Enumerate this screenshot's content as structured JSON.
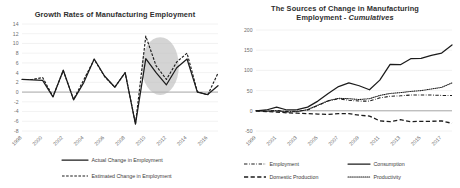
{
  "left_panel": {
    "title": "Growth Rates of Manufacturing Employment",
    "legend": [
      {
        "label": "Actual Change in Employment",
        "style": "solid"
      },
      {
        "label": "Estimated Change in Employment",
        "style": "dashed"
      }
    ],
    "highlight_note": "gray-ellipse-highlight"
  },
  "right_panel": {
    "title_line1": "The Sources of Change in Manufacturing",
    "title_line2_plain": "Employment - ",
    "title_line2_italic": "Cumulatives",
    "legend": [
      {
        "label": "Employment",
        "style": "dash-dot"
      },
      {
        "label": "Consumption",
        "style": "solid"
      },
      {
        "label": "Domestic Production",
        "style": "long-dash"
      },
      {
        "label": "Productivity",
        "style": "dotted"
      }
    ]
  },
  "chart_data": [
    {
      "type": "line",
      "title": "Growth Rates of Manufacturing Employment",
      "xlabel": "",
      "ylabel": "",
      "ylim": [
        -8,
        14
      ],
      "yticks": [
        14,
        12,
        10,
        8,
        6,
        4,
        2,
        0,
        -2,
        -4,
        -6,
        -8
      ],
      "xticks": [
        "1998",
        "2000",
        "2002",
        "2004",
        "2006",
        "2008",
        "2010",
        "2012",
        "2014",
        "2016"
      ],
      "grid": true,
      "legend_position": "bottom",
      "x": [
        1998,
        1999,
        2000,
        2001,
        2002,
        2003,
        2004,
        2005,
        2006,
        2007,
        2008,
        2009,
        2010,
        2011,
        2012,
        2013,
        2014,
        2015,
        2016,
        2017
      ],
      "series": [
        {
          "name": "Actual Change in Employment",
          "style": "solid",
          "values": [
            2.6,
            2.5,
            2.4,
            -1.0,
            4.5,
            -1.6,
            2.0,
            6.8,
            3.3,
            1.0,
            4.0,
            -6.6,
            6.9,
            4.0,
            1.5,
            5.0,
            6.8,
            0.0,
            -0.5,
            1.3
          ]
        },
        {
          "name": "Estimated Change in Employment",
          "style": "dashed",
          "values": [
            2.6,
            2.6,
            3.0,
            -0.9,
            4.4,
            -1.5,
            2.6,
            6.7,
            3.2,
            1.0,
            4.0,
            -6.5,
            11.5,
            5.4,
            2.6,
            6.2,
            8.0,
            0.1,
            -0.6,
            3.9
          ]
        }
      ],
      "annotations": [
        {
          "type": "ellipse",
          "label": "gray-ellipse-highlight",
          "x_range": [
            2009.6,
            2013.2
          ],
          "y_range": [
            -0.6,
            11.3
          ],
          "color": "#b9b9b9"
        }
      ]
    },
    {
      "type": "line",
      "title": "The Sources of Change in Manufacturing Employment - Cumulatives",
      "xlabel": "",
      "ylabel": "",
      "ylim": [
        -50,
        200
      ],
      "yticks": [
        200,
        150,
        100,
        50,
        0,
        -50
      ],
      "xticks": [
        "1999",
        "2001",
        "2003",
        "2005",
        "2007",
        "2009",
        "2011",
        "2013",
        "2015",
        "2017"
      ],
      "grid": true,
      "legend_position": "bottom",
      "x": [
        1999,
        2000,
        2001,
        2002,
        2003,
        2004,
        2005,
        2006,
        2007,
        2008,
        2009,
        2010,
        2011,
        2012,
        2013,
        2014,
        2015,
        2016,
        2017,
        2018
      ],
      "series": [
        {
          "name": "Consumption",
          "style": "solid",
          "values": [
            0,
            2,
            9,
            2,
            3,
            9,
            24,
            43,
            60,
            69,
            62,
            52,
            76,
            115,
            114,
            129,
            130,
            137,
            143,
            163
          ]
        },
        {
          "name": "Employment",
          "style": "dash-dot",
          "values": [
            0,
            -1,
            1,
            -2,
            -1,
            2,
            13,
            24,
            30,
            26,
            24,
            24,
            32,
            36,
            37,
            39,
            39,
            39,
            38,
            38
          ]
        },
        {
          "name": "Domestic Production",
          "style": "long-dash",
          "values": [
            0,
            -2,
            -3,
            -5,
            -6,
            -7,
            -8,
            -9,
            -7,
            -7,
            -11,
            -13,
            -25,
            -27,
            -22,
            -27,
            -26,
            -26,
            -25,
            -31
          ]
        },
        {
          "name": "Productivity",
          "style": "dotted",
          "values": [
            0,
            -1,
            0,
            -3,
            -2,
            3,
            14,
            25,
            31,
            30,
            28,
            30,
            38,
            43,
            45,
            48,
            50,
            54,
            58,
            69
          ]
        }
      ]
    }
  ]
}
